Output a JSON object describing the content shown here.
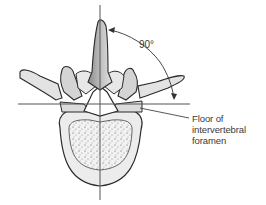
{
  "figure": {
    "angle_label": "90°",
    "callout": {
      "lines": [
        "Floor of",
        "intervertebral",
        "foramen"
      ]
    },
    "colors": {
      "line": "#555555",
      "bone_outline": "#2b2b2b",
      "bone_fill": "#e6e6e6",
      "bone_shade": "#a8a8a8",
      "text": "#3a3a3a",
      "background": "#ffffff"
    }
  }
}
